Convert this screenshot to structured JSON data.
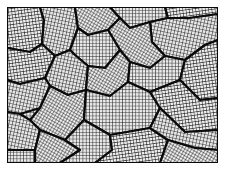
{
  "figure": {
    "title": "",
    "frame": {
      "x": 7,
      "y": 7,
      "width": 211,
      "height": 156
    },
    "colors": {
      "background": "#ffffff",
      "grid_line": "#1a1a1a",
      "grain_fill": "#e8e8e8",
      "boundary": "#0a0a0a"
    },
    "grains": [
      {
        "id": "g1",
        "points": "7,7 40,7 44,20 42,44 30,52 7,48"
      },
      {
        "id": "g2",
        "points": "40,7 75,7 78,28 70,50 55,56 42,44 44,20"
      },
      {
        "id": "g3",
        "points": "75,7 110,7 120,18 108,30 88,35 78,28"
      },
      {
        "id": "g4",
        "points": "110,7 165,7 168,18 150,22 130,28 120,18"
      },
      {
        "id": "g5",
        "points": "165,7 218,7 218,14 190,18 168,18"
      },
      {
        "id": "g6",
        "points": "168,18 190,18 218,14 218,40 205,45 185,60 165,56 152,42 150,22"
      },
      {
        "id": "g7",
        "points": "130,28 150,22 152,42 165,56 150,68 130,62 120,50 108,30 120,18"
      },
      {
        "id": "g8",
        "points": "78,28 88,35 108,30 120,50 105,68 88,66 75,55 70,50"
      },
      {
        "id": "g9",
        "points": "7,48 30,52 42,44 55,56 45,78 20,84 7,80"
      },
      {
        "id": "g10",
        "points": "55,56 70,50 75,55 88,66 86,90 68,95 50,86 45,78"
      },
      {
        "id": "g11",
        "points": "88,66 105,68 120,50 130,62 128,82 110,96 86,90"
      },
      {
        "id": "g12",
        "points": "130,62 150,68 165,56 185,60 180,80 150,92 128,82"
      },
      {
        "id": "g13",
        "points": "185,60 205,45 218,40 218,98 200,100 180,80"
      },
      {
        "id": "g14",
        "points": "7,80 20,84 45,78 50,86 40,108 20,114 7,112"
      },
      {
        "id": "g15",
        "points": "50,86 68,95 86,90 84,120 65,140 40,130 30,120 40,108"
      },
      {
        "id": "g16",
        "points": "86,90 110,96 128,82 150,92 160,108 150,128 110,135 84,120"
      },
      {
        "id": "g17",
        "points": "150,92 180,80 200,100 218,98 218,130 185,132 160,108"
      },
      {
        "id": "g18",
        "points": "7,112 20,114 30,120 40,130 35,150 7,150"
      },
      {
        "id": "g19",
        "points": "40,130 65,140 80,150 60,163 35,163 35,150"
      },
      {
        "id": "g20",
        "points": "84,120 110,135 112,150 95,163 60,163 80,150 65,140"
      },
      {
        "id": "g21",
        "points": "110,135 150,128 168,140 160,163 95,163 112,150"
      },
      {
        "id": "g22",
        "points": "150,128 160,108 185,132 218,130 218,150 195,148 168,140"
      },
      {
        "id": "g23",
        "points": "168,140 195,148 218,150 218,163 160,163"
      },
      {
        "id": "g24",
        "points": "7,150 35,150 35,163 7,163"
      }
    ]
  }
}
